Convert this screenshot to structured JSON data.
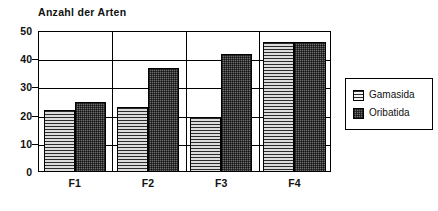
{
  "chart_data": {
    "type": "bar",
    "title": "Anzahl der Arten",
    "xlabel": "",
    "ylabel": "",
    "categories": [
      "F1",
      "F2",
      "F3",
      "F4"
    ],
    "series": [
      {
        "name": "Gamasida",
        "values": [
          22,
          23,
          19.5,
          46
        ]
      },
      {
        "name": "Oribatida",
        "values": [
          25,
          37,
          42,
          46
        ]
      }
    ],
    "ylim": [
      0,
      50
    ],
    "yticks": [
      0,
      10,
      20,
      30,
      40,
      50
    ],
    "ytick_labels": [
      "0",
      "10",
      "20",
      "30",
      "40",
      "50"
    ],
    "grid": true,
    "grid_axis": "y",
    "legend_position": "right",
    "group_dividers": true,
    "colors": {
      "gamasida": "#d0d0d0",
      "oribatida": "#6f6f6f",
      "axis": "#000000",
      "text": "#111111",
      "background": "#ffffff"
    }
  },
  "legend": {
    "entries": [
      {
        "label": "Gamasida",
        "pattern": "horizontal-stripes"
      },
      {
        "label": "Oribatida",
        "pattern": "stipple-checker"
      }
    ]
  }
}
